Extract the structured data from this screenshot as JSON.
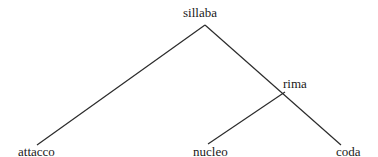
{
  "diagram": {
    "type": "syllable-tree",
    "nodes": {
      "root": "sillaba",
      "rhyme": "rima",
      "onset": "attacco",
      "nucleus": "nucleo",
      "coda": "coda"
    },
    "edges": [
      [
        "sillaba",
        "attacco"
      ],
      [
        "sillaba",
        "rima"
      ],
      [
        "rima",
        "nucleo"
      ],
      [
        "rima",
        "coda"
      ]
    ],
    "line_color": "#2b2b2b"
  }
}
